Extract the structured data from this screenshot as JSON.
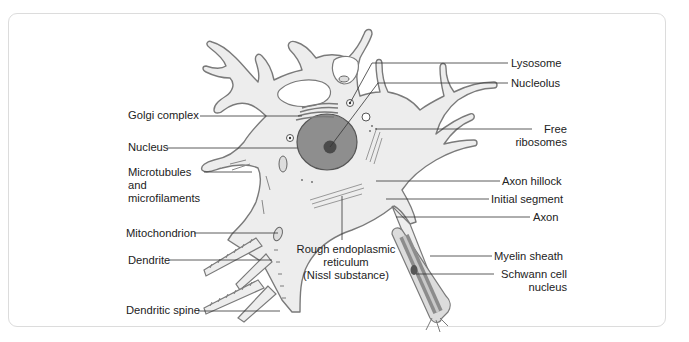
{
  "diagram": {
    "colors": {
      "cytoplasm_fill": "#ededed",
      "outline": "#7a7a7a",
      "nucleus_fill": "#8e8e8e",
      "nucleolus_fill": "#4a4a4a",
      "myelin_fill": "#8c8c8c",
      "leader_line": "#333333",
      "panel_border": "#dcdcdc",
      "text": "#222222"
    },
    "labels_left": [
      {
        "id": "golgi",
        "text": "Golgi complex"
      },
      {
        "id": "nucleus",
        "text": "Nucleus"
      },
      {
        "id": "microtubules",
        "line1": "Microtubules",
        "line2": "and",
        "line3": "microfilaments"
      },
      {
        "id": "mitochondrion",
        "text": "Mitochondrion"
      },
      {
        "id": "dendrite",
        "text": "Dendrite"
      },
      {
        "id": "dendritic_spine",
        "text": "Dendritic spine"
      }
    ],
    "labels_right": [
      {
        "id": "lysosome",
        "text": "Lysosome"
      },
      {
        "id": "nucleolus",
        "text": "Nucleolus"
      },
      {
        "id": "free_ribosomes",
        "line1": "Free",
        "line2": "ribosomes"
      },
      {
        "id": "axon_hillock",
        "text": "Axon hillock"
      },
      {
        "id": "initial_segment",
        "text": "Initial segment"
      },
      {
        "id": "axon",
        "text": "Axon"
      },
      {
        "id": "myelin_sheath",
        "text": "Myelin sheath"
      },
      {
        "id": "schwann",
        "line1": "Schwann cell",
        "line2": "nucleus"
      }
    ],
    "labels_center": [
      {
        "id": "rer",
        "line1": "Rough endoplasmic",
        "line2": "reticulum",
        "line3": "(Nissl substance)"
      }
    ]
  }
}
